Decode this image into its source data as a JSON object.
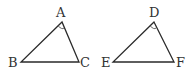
{
  "diagram": {
    "background": "#ffffff",
    "stroke_color": "#2a2a2a",
    "triangles": [
      {
        "name": "ABC",
        "vertices": {
          "A": {
            "label": "A",
            "x": 62,
            "y": 22,
            "lx": 56,
            "ly": 17
          },
          "B": {
            "label": "B",
            "x": 21,
            "y": 62,
            "lx": 8,
            "ly": 67
          },
          "C": {
            "label": "C",
            "x": 79,
            "y": 62,
            "lx": 80,
            "ly": 67
          }
        },
        "marked_angle": "A"
      },
      {
        "name": "DEF",
        "vertices": {
          "D": {
            "label": "D",
            "x": 154,
            "y": 22,
            "lx": 149,
            "ly": 17
          },
          "E": {
            "label": "E",
            "x": 113,
            "y": 62,
            "lx": 101,
            "ly": 67
          },
          "F": {
            "label": "F",
            "x": 174,
            "y": 62,
            "lx": 176,
            "ly": 67
          }
        },
        "marked_angle": "D"
      }
    ]
  }
}
